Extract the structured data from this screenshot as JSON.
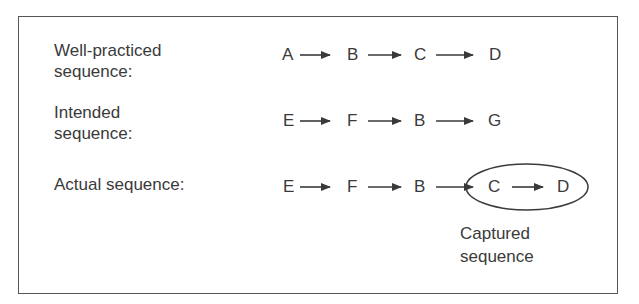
{
  "rows": [
    {
      "label": "Well-practiced sequence:",
      "label_lines": [
        "Well-practiced",
        "sequence:"
      ],
      "nodes": [
        "A",
        "B",
        "C",
        "D"
      ]
    },
    {
      "label": "Intended sequence:",
      "label_lines": [
        "Intended",
        "sequence:"
      ],
      "nodes": [
        "E",
        "F",
        "B",
        "G"
      ]
    },
    {
      "label": "Actual sequence:",
      "label_lines": [
        "Actual sequence:"
      ],
      "nodes": [
        "E",
        "F",
        "B",
        "C",
        "D"
      ]
    }
  ],
  "captured": {
    "lines": [
      "Captured",
      "sequence"
    ],
    "circled_nodes": [
      "C",
      "D"
    ]
  }
}
